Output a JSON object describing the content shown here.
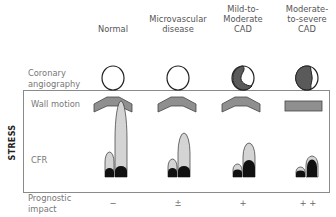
{
  "columns": [
    {
      "id": "normal",
      "label": "Normal",
      "x": 113,
      "impact": "−"
    },
    {
      "id": "microvascular",
      "label": "Microvascular disease",
      "x": 178,
      "impact": "±"
    },
    {
      "id": "mild",
      "label": "Mild-to-Moderate CAD",
      "x": 243,
      "impact": "+"
    },
    {
      "id": "severe",
      "label": "Moderate-to-severe CAD",
      "x": 307,
      "impact": "+ +"
    }
  ],
  "headers": {
    "normal": "Normal",
    "microvascular_1": "Microvascular",
    "microvascular_2": "disease",
    "mild_1": "Mild-to-",
    "mild_2": "Moderate",
    "mild_3": "CAD",
    "severe_1": "Moderate-",
    "severe_2": "to-severe",
    "severe_3": "CAD"
  },
  "rows": {
    "coronary_1": "Coronary",
    "coronary_2": "angiography",
    "wall_motion": "Wall motion",
    "cfr": "CFR",
    "prognostic_1": "Prognostic",
    "prognostic_2": "impact"
  },
  "stress_label": "STRESS",
  "impacts": {
    "normal": "−",
    "microvascular": "±",
    "mild": "+",
    "severe": "+ +"
  },
  "colors": {
    "stenosis_fill": "#5a5a5a",
    "wall_fill": "#8f8f8f",
    "cfr_rest": "#111111",
    "cfr_stress": "#d4d4d4",
    "outline": "#222222",
    "box_border": "#8a8a8a"
  }
}
